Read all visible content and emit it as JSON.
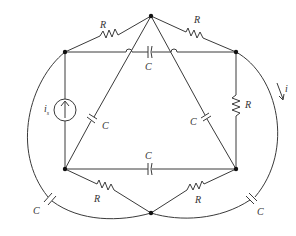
{
  "diagram": {
    "type": "circuit",
    "labels": {
      "resistor": "R",
      "capacitor": "C",
      "source_current": "i",
      "source_subscript": "s",
      "loop_current": "i"
    },
    "components": [
      {
        "id": "R_top_left",
        "kind": "resistor",
        "label": "R",
        "between": [
          "top_left",
          "apex_top"
        ]
      },
      {
        "id": "R_top_right",
        "kind": "resistor",
        "label": "R",
        "between": [
          "apex_top",
          "top_right"
        ]
      },
      {
        "id": "C_top_horizontal",
        "kind": "capacitor",
        "label": "C",
        "between": [
          "top_left",
          "top_right"
        ]
      },
      {
        "id": "R_right_vertical",
        "kind": "resistor",
        "label": "R",
        "between": [
          "top_right",
          "bottom_right"
        ]
      },
      {
        "id": "C_left_diag",
        "kind": "capacitor",
        "label": "C",
        "between": [
          "apex_top",
          "bottom_left"
        ]
      },
      {
        "id": "C_right_diag",
        "kind": "capacitor",
        "label": "C",
        "between": [
          "apex_top",
          "bottom_right"
        ]
      },
      {
        "id": "C_bottom_horizontal",
        "kind": "capacitor",
        "label": "C",
        "between": [
          "bottom_left",
          "bottom_right"
        ]
      },
      {
        "id": "R_bottom_left",
        "kind": "resistor",
        "label": "R",
        "between": [
          "bottom_left",
          "apex_bottom"
        ]
      },
      {
        "id": "R_bottom_right",
        "kind": "resistor",
        "label": "R",
        "between": [
          "bottom_right",
          "apex_bottom"
        ]
      },
      {
        "id": "I_source",
        "kind": "current_source",
        "label": "i_s",
        "between": [
          "bottom_left",
          "top_left"
        ],
        "direction": "up"
      },
      {
        "id": "C_left_arc",
        "kind": "capacitor",
        "label": "C",
        "between": [
          "top_left",
          "apex_bottom"
        ]
      },
      {
        "id": "C_right_arc",
        "kind": "capacitor",
        "label": "C",
        "between": [
          "top_right",
          "apex_bottom"
        ]
      }
    ],
    "nodes": [
      "apex_top",
      "top_left",
      "top_right",
      "bottom_left",
      "bottom_right",
      "apex_bottom"
    ],
    "current_arrow": {
      "label": "i",
      "location": "right_arc",
      "direction": "downward"
    }
  }
}
